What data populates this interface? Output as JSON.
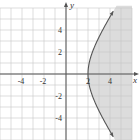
{
  "chart_data": {
    "type": "line",
    "title": "",
    "xlabel": "x",
    "ylabel": "y",
    "xlim": [
      -6,
      6
    ],
    "ylim": [
      -6,
      6
    ],
    "grid": true,
    "x_ticks": [
      {
        "value": -4,
        "label": "-4"
      },
      {
        "value": -2,
        "label": "-2"
      },
      {
        "value": 2,
        "label": "2"
      },
      {
        "value": 4,
        "label": "4"
      }
    ],
    "y_ticks": [
      {
        "value": 4,
        "label": "4"
      },
      {
        "value": 2,
        "label": "2"
      },
      {
        "value": -2,
        "label": "-2"
      },
      {
        "value": -4,
        "label": "-4"
      }
    ],
    "series": [
      {
        "name": "boundary curve (right branch of hyperbola x^2/4 - y^2/9 = 1)",
        "style": "solid",
        "arrows": true,
        "points": [
          [
            4.47,
            -6
          ],
          [
            3.61,
            -4.5
          ],
          [
            2.83,
            -3
          ],
          [
            2.24,
            -1.5
          ],
          [
            2,
            0
          ],
          [
            2.24,
            1.5
          ],
          [
            2.83,
            3
          ],
          [
            3.61,
            4.5
          ],
          [
            4.47,
            6
          ]
        ]
      }
    ],
    "shaded_region": "x^2/4 - y^2/9 >= 1, x > 0 (right of curve)",
    "colors": {
      "shade": "#dcdcdc",
      "grid": "#c8c8c8",
      "axis": "#555555",
      "curve": "#555555"
    }
  }
}
